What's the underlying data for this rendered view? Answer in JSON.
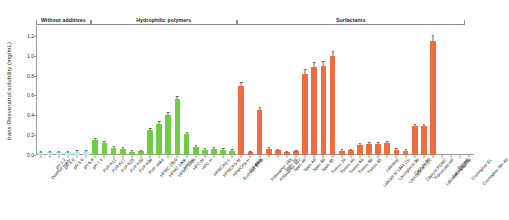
{
  "chart_data": {
    "type": "bar",
    "title": "",
    "subtitle": "",
    "xlabel": "",
    "ylabel": "trans-Resveratrol solubility (mg/mL)",
    "ylabel_italic_prefix": "trans",
    "ylabel_rest": "-Resveratrol solubility (mg/mL)",
    "ylim": [
      0.0,
      1.3
    ],
    "yticks": [
      0.0,
      0.2,
      0.4,
      0.6,
      0.8,
      1.0,
      1.2
    ],
    "ytick_labels": [
      "0.0",
      "0.2",
      "0.4",
      "0.6",
      "0.8",
      "1.0",
      "1.2"
    ],
    "grid": false,
    "legend": "none",
    "legend_position": "none",
    "group_headers": [
      {
        "label": "Without additives",
        "start_index": 0,
        "end_index": 5
      },
      {
        "label": "Hydrophilic polymers",
        "start_index": 6,
        "end_index": 21
      },
      {
        "label": "Surfactants",
        "start_index": 22,
        "end_index": 46
      }
    ],
    "series": [
      {
        "name": "trans-Resveratrol solubility",
        "categories": [
          "Distilled water",
          "pH 1.2",
          "pH 4.0",
          "pH 5.0",
          "pH 6.8",
          "pH 7.4",
          "PVP K12",
          "PVP K17",
          "PVP K25",
          "PVP K30",
          "PVP K90",
          "PVP VA64",
          "HPMC 2910",
          "HPMC 2906",
          "HPMC 2208",
          "HPC-L",
          "HPC-M",
          "HPC-H",
          "HPMCAS-L",
          "HPMCAS-M",
          "HPMCAS-H",
          "Eudragit E PO",
          "Soluplus",
          "SLS",
          "Poloxamer 188",
          "Poloxamer 407",
          "Span 20",
          "Span 40",
          "Span 60",
          "Span 80",
          "Span 85",
          "Tween 20",
          "Tween 40",
          "Tween 60",
          "Tween 80",
          "Tween 85",
          "Labrafil M 1944 CS",
          "Labrasol",
          "Lauroglycol 90",
          "Lauroglycol FCC",
          "Capryol 90",
          "Capryol PGMC",
          "Transcutol HP",
          "Labrafac Lipophile",
          "Labrafac PG",
          "Peceol",
          "Cremophor EL",
          "Cremophor RH 40"
        ],
        "values": [
          0.03,
          0.029,
          0.03,
          0.031,
          0.032,
          0.034,
          0.15,
          0.12,
          0.075,
          0.065,
          0.035,
          0.04,
          0.25,
          0.31,
          0.4,
          0.56,
          0.21,
          0.085,
          0.055,
          0.06,
          0.055,
          0.045,
          0.7,
          0.03,
          0.45,
          0.06,
          0.05,
          0.03,
          0.04,
          0.82,
          0.89,
          0.9,
          1.0,
          0.045,
          0.05,
          0.1,
          0.11,
          0.11,
          0.12,
          0.055,
          0.045,
          0.29,
          0.29,
          1.15
        ],
        "errors": [
          0.004,
          0.004,
          0.004,
          0.004,
          0.004,
          0.004,
          0.01,
          0.01,
          0.008,
          0.006,
          0.004,
          0.004,
          0.015,
          0.018,
          0.02,
          0.025,
          0.014,
          0.008,
          0.005,
          0.006,
          0.005,
          0.005,
          0.03,
          0.004,
          0.022,
          0.006,
          0.005,
          0.004,
          0.005,
          0.035,
          0.035,
          0.035,
          0.04,
          0.005,
          0.005,
          0.008,
          0.009,
          0.009,
          0.01,
          0.005,
          0.005,
          0.016,
          0.016,
          0.045
        ],
        "colors": [
          "#b8e8ee",
          "#b8e8ee",
          "#b8e8ee",
          "#b8e8ee",
          "#b8e8ee",
          "#b8e8ee",
          "#6fcc44",
          "#6fcc44",
          "#6fcc44",
          "#6fcc44",
          "#6fcc44",
          "#6fcc44",
          "#6fcc44",
          "#6fcc44",
          "#6fcc44",
          "#6fcc44",
          "#6fcc44",
          "#6fcc44",
          "#6fcc44",
          "#6fcc44",
          "#6fcc44",
          "#6fcc44",
          "#ef6b41",
          "#ef6b41",
          "#ef6b41",
          "#ef6b41",
          "#ef6b41",
          "#ef6b41",
          "#ef6b41",
          "#ef6b41",
          "#ef6b41",
          "#ef6b41",
          "#ef6b41",
          "#ef6b41",
          "#ef6b41",
          "#ef6b41",
          "#ef6b41",
          "#ef6b41",
          "#ef6b41",
          "#ef6b41",
          "#ef6b41",
          "#ef6b41",
          "#ef6b41",
          "#ef6b41",
          "#ef6b41"
        ]
      }
    ],
    "palette": {
      "without_additives": "#b8e8ee",
      "hydrophilic_polymers": "#6fcc44",
      "surfactants": "#ef6b41",
      "axis": "#9a9a9a",
      "text": "#111111",
      "error_bar": "#6b6b6b"
    }
  }
}
